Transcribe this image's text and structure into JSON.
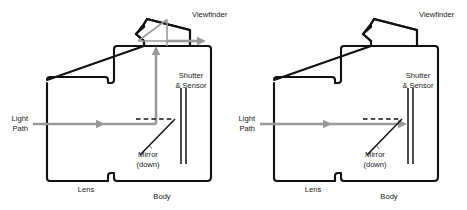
{
  "colors": {
    "outline": "#111111",
    "ray": "#999999",
    "label_text": "#1a1a1a",
    "leader": "#555555",
    "background": "#ffffff"
  },
  "panels": [
    {
      "id": "left-panel",
      "name": "mirror-down-view",
      "labels": {
        "viewfinder": "Viewfinder",
        "shutter_sensor_line1": "Shutter",
        "shutter_sensor_line2": "& Sensor",
        "light_path_line1": "Light",
        "light_path_line2": "Path",
        "mirror_line1": "Mirror",
        "mirror_line2": "(down)",
        "lens": "Lens",
        "body": "Body"
      }
    },
    {
      "id": "right-panel",
      "name": "mirror-up-view",
      "labels": {
        "viewfinder": "Viewfinder",
        "shutter_sensor_line1": "Shutter",
        "shutter_sensor_line2": "& Sensor",
        "light_path_line1": "Light",
        "light_path_line2": "Path",
        "mirror_line1": "Mirror",
        "mirror_line2": "(down)",
        "lens": "Lens",
        "body": "Body"
      }
    }
  ]
}
